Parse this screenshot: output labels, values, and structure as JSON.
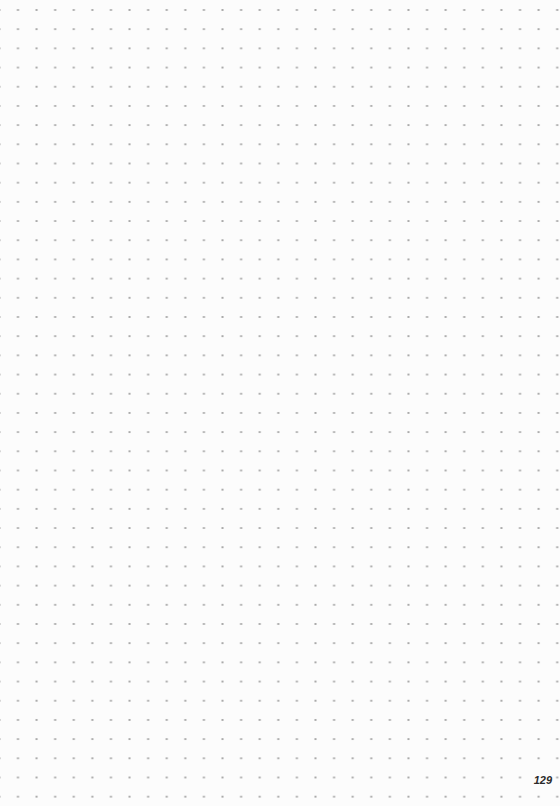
{
  "page": {
    "type": "dot-grid notebook page",
    "page_number": "129"
  },
  "colors": {
    "paper": "#fcfcfc",
    "dot": "#a9a9a9",
    "page_number": "#2a2a2a"
  }
}
